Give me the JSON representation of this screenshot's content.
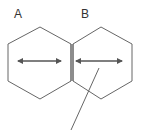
{
  "diagram": {
    "type": "hexagon-pair",
    "colors": {
      "stroke": "#666666",
      "arrow": "#555555",
      "text": "#333333",
      "background": "#ffffff"
    },
    "shapes": [
      {
        "id": "A",
        "label": "A",
        "shape": "hexagon",
        "points": "40,27 71,44 71,81 40,99 8,81 8,44",
        "arrow": {
          "x1": 17,
          "x2": 62,
          "y": 61,
          "heads": "both"
        }
      },
      {
        "id": "B",
        "label": "B",
        "shape": "hexagon",
        "points": "101,27 132,44 132,81 101,99 73,81 73,44",
        "arrow": {
          "x1": 75,
          "x2": 123,
          "y": 61,
          "heads": "both"
        }
      }
    ],
    "shared_edge": {
      "x1": 71,
      "y1": 44,
      "x2": 71,
      "y2": 81,
      "double": true
    },
    "pointer_line": {
      "x1": 99,
      "y1": 68,
      "x2": 71,
      "y2": 130
    }
  }
}
